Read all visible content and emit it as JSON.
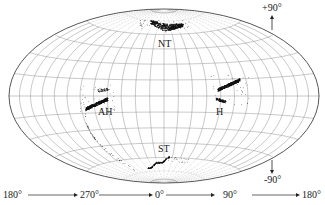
{
  "figure": {
    "projection": "Aitoff-Hammer all-sky (equal-area)",
    "graticule": {
      "longitude_step_deg": 15,
      "latitude_step_deg": 15,
      "polar_dotted_lat_deg": 60
    },
    "clusters": [
      {
        "id": "NT",
        "label": "NT",
        "lon": 0,
        "lat": 68
      },
      {
        "id": "AH",
        "label": "AH",
        "lon": -85,
        "lat": -5
      },
      {
        "id": "H",
        "label": "H",
        "lon": 85,
        "lat": 4
      },
      {
        "id": "ST",
        "label": "ST",
        "lon": -5,
        "lat": -68
      }
    ],
    "latitude_indicators": {
      "north": "+90°",
      "south": "-90°"
    },
    "longitude_axis": [
      "180°",
      "270°",
      "0°",
      "90°",
      "180°"
    ]
  }
}
